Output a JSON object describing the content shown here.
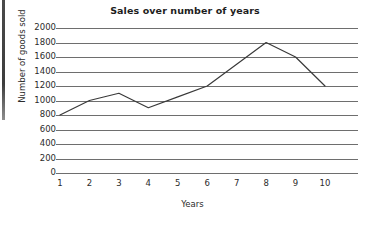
{
  "chart_data": {
    "type": "line",
    "title": "Sales over number of years",
    "xlabel": "Years",
    "ylabel": "Number of goods sold",
    "categories": [
      1,
      2,
      3,
      4,
      5,
      6,
      7,
      8,
      9,
      10
    ],
    "x_tick_labels": [
      "1",
      "2",
      "3",
      "4",
      "5",
      "6",
      "7",
      "8",
      "9",
      "10"
    ],
    "values": [
      800,
      1000,
      1100,
      900,
      1050,
      1200,
      1500,
      1800,
      1600,
      1200
    ],
    "series": [
      {
        "name": "Number of goods sold",
        "values": [
          800,
          1000,
          1100,
          900,
          1050,
          1200,
          1500,
          1800,
          1600,
          1200
        ]
      }
    ],
    "ylim": [
      0,
      2000
    ],
    "y_tick_step": 200,
    "y_tick_labels": [
      "2000",
      "1800",
      "1600",
      "1400",
      "1200",
      "1000",
      "800",
      "600",
      "400",
      "200",
      "0"
    ],
    "y_ticks": [
      2000,
      1800,
      1600,
      1400,
      1200,
      1000,
      800,
      600,
      400,
      200,
      0
    ],
    "xlim": [
      1,
      10
    ],
    "grid": "horizontal-only",
    "legend": "none",
    "line_color": "#3a3a3a",
    "grid_color": "#6e6e6e",
    "markers": "none"
  }
}
